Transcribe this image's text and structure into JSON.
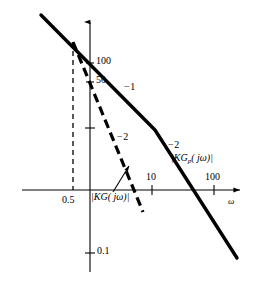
{
  "figure": {
    "kind": "bode-magnitude-plot",
    "background": "#ffffff",
    "ink": "#000000"
  },
  "axes": {
    "x_axis_label": "ω",
    "y_axis_label": "",
    "x_ticks": [
      {
        "value": 0.5,
        "label": "0.5",
        "px": 73,
        "dashed_guide": true
      },
      {
        "value": 10,
        "label": "10",
        "px": 152,
        "dashed_guide": false
      },
      {
        "value": 100,
        "label": "100",
        "px": 214,
        "dashed_guide": false
      }
    ],
    "y_ticks": [
      {
        "value": 100,
        "label": "100",
        "px": 63
      },
      {
        "value": 50,
        "label": "50",
        "px": 82
      },
      {
        "value": 10,
        "label": "",
        "px": 128
      },
      {
        "value": 0.1,
        "label": "0.1",
        "px": 253
      }
    ],
    "origin_px": {
      "x": 90,
      "y": 190
    },
    "decade_px": 62,
    "scale": "log-log"
  },
  "curves": [
    {
      "name": "KGp",
      "label": "|KG",
      "label_sub": "p",
      "label_tail": "( jω)|",
      "style": "solid",
      "width": 3.2,
      "segments": [
        {
          "slope": -1,
          "from_px": [
            41,
            15
          ],
          "to_px": [
            155,
            130
          ]
        },
        {
          "slope": -2,
          "from_px": [
            155,
            130
          ],
          "to_px": [
            237,
            258
          ]
        }
      ],
      "slope_labels": [
        {
          "text": "−1",
          "px": [
            127,
            84
          ]
        },
        {
          "text": "−2",
          "px": [
            170,
            142
          ]
        }
      ]
    },
    {
      "name": "KG",
      "label": "|KG( jω)|",
      "style": "dashed",
      "width": 3.0,
      "segments": [
        {
          "slope": -2,
          "from_px": [
            73,
            42
          ],
          "to_px": [
            143,
            212
          ]
        }
      ],
      "slope_labels": [
        {
          "text": "−2",
          "px": [
            120,
            134
          ]
        }
      ]
    }
  ],
  "annotations": {
    "kg_label": {
      "text_head": "|KG( jω)|",
      "px": [
        92,
        192
      ]
    },
    "kgp_label": {
      "px": [
        172,
        154
      ]
    },
    "leader_line": {
      "from_px": [
        114,
        192
      ],
      "to_px": [
        129,
        167
      ]
    },
    "guide_line_05": {
      "x_px": 73,
      "y_top_px": 42,
      "y_bottom_px": 190
    }
  },
  "labels": {
    "tick_x_05": "0.5",
    "tick_x_10": "10",
    "tick_x_100": "100",
    "tick_y_100": "100",
    "tick_y_50": "50",
    "tick_y_01": "0.1",
    "omega": "ω",
    "slope_minus1": "−1",
    "slope_minus2_dashed": "−2",
    "slope_minus2_solid": "−2",
    "kg_magnitude": "|KG( jω)|",
    "kgp_magnitude_pre": "|KG",
    "kgp_magnitude_sub": "p",
    "kgp_magnitude_post": "( jω)|"
  }
}
